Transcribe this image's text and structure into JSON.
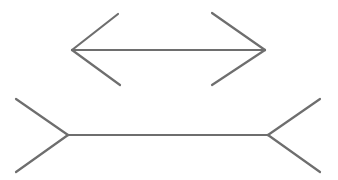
{
  "figure": {
    "background_color": "#ffffff",
    "canvas": {
      "width": 338,
      "height": 180
    },
    "stroke": {
      "color": "#6e6e6e",
      "width": 2.2,
      "linecap": "round"
    }
  },
  "chart_data": {
    "type": "diagram",
    "xlabel": "",
    "ylabel": "",
    "grid": false,
    "legend": null,
    "coordinate_space": {
      "x": [
        0,
        338
      ],
      "y": [
        0,
        180
      ],
      "y_axis_down": true
    },
    "shapes": [
      {
        "name": "top-figure-arrowheads-inward",
        "description": "Double-headed arrow with fins pointing inward (appears shorter)",
        "shaft": {
          "x1": 72,
          "y1": 50,
          "x2": 265,
          "y2": 50,
          "length": 193
        },
        "fins": [
          {
            "name": "top-left-upper-fin",
            "x1": 72,
            "y1": 50,
            "x2": 118,
            "y2": 14
          },
          {
            "name": "top-left-lower-fin",
            "x1": 72,
            "y1": 50,
            "x2": 120,
            "y2": 85
          },
          {
            "name": "top-right-upper-fin",
            "x1": 265,
            "y1": 50,
            "x2": 212,
            "y2": 13
          },
          {
            "name": "top-right-lower-fin",
            "x1": 265,
            "y1": 50,
            "x2": 212,
            "y2": 85
          }
        ]
      },
      {
        "name": "bottom-figure-arrowheads-outward",
        "description": "Line with fins pointing outward (appears longer)",
        "shaft": {
          "x1": 68,
          "y1": 135,
          "x2": 268,
          "y2": 135,
          "length": 200
        },
        "fins": [
          {
            "name": "bottom-left-upper-fin",
            "x1": 68,
            "y1": 135,
            "x2": 16,
            "y2": 99
          },
          {
            "name": "bottom-left-lower-fin",
            "x1": 68,
            "y1": 135,
            "x2": 16,
            "y2": 172
          },
          {
            "name": "bottom-right-upper-fin",
            "x1": 268,
            "y1": 135,
            "x2": 320,
            "y2": 99
          },
          {
            "name": "bottom-right-lower-fin",
            "x1": 268,
            "y1": 135,
            "x2": 320,
            "y2": 172
          }
        ]
      }
    ]
  }
}
